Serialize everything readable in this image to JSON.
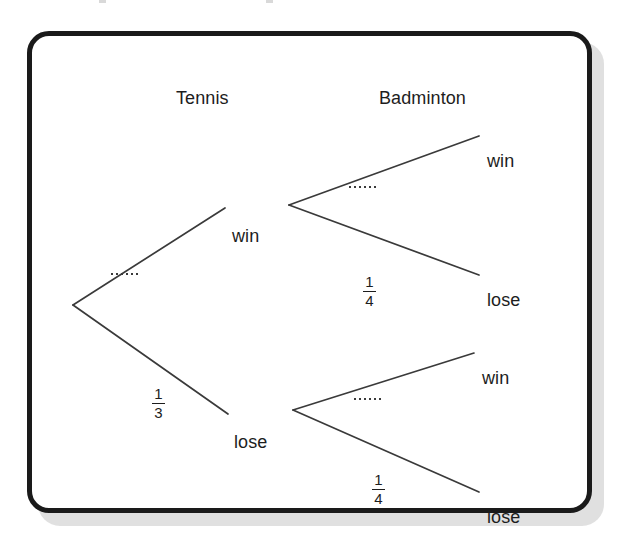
{
  "figure": {
    "type": "probability-tree-diagram",
    "columns": [
      {
        "id": "tennis",
        "label": "Tennis"
      },
      {
        "id": "badminton",
        "label": "Badminton"
      }
    ],
    "nodes": {
      "root": {
        "label": ""
      },
      "tennis_win": {
        "label": "win"
      },
      "tennis_lose": {
        "label": "lose"
      },
      "bad_win_win": {
        "label": "win"
      },
      "bad_win_lose": {
        "label": "lose"
      },
      "bad_lose_win": {
        "label": "win"
      },
      "bad_lose_lose": {
        "label": "lose"
      }
    },
    "edge_labels": {
      "tennis_win": {
        "kind": "dots",
        "text": "......",
        "dot_count": 6
      },
      "tennis_lose": {
        "kind": "fraction",
        "numerator": "1",
        "denominator": "3",
        "text": "1/3"
      },
      "bad_win_win": {
        "kind": "dots",
        "text": "......",
        "dot_count": 6
      },
      "bad_win_lose": {
        "kind": "fraction",
        "numerator": "1",
        "denominator": "4",
        "text": "1/4"
      },
      "bad_lose_win": {
        "kind": "dots",
        "text": "......",
        "dot_count": 6
      },
      "bad_lose_lose": {
        "kind": "fraction",
        "numerator": "1",
        "denominator": "4",
        "text": "1/4"
      }
    },
    "colors": {
      "ink": "#1d1d1d",
      "frame": "#1a1a1a",
      "branch": "#3a3a3a",
      "paper": "#ffffff",
      "shadow": "#d6d6d6"
    }
  }
}
